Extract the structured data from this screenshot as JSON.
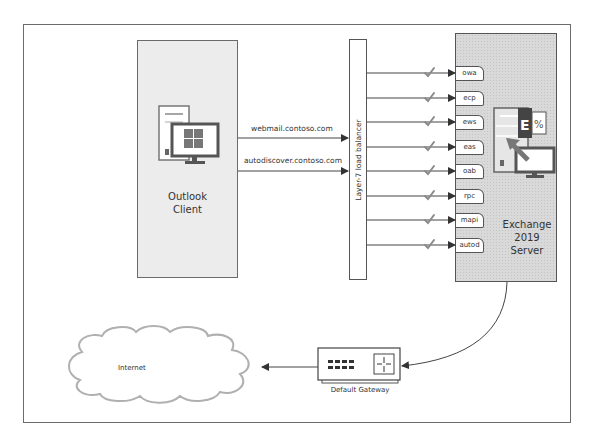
{
  "diagram": {
    "client": {
      "label_line1": "Outlook",
      "label_line2": "Client",
      "icon": "windows-desktop-icon"
    },
    "connections": {
      "webmail": "webmail.contoso.com",
      "autodiscover": "autodiscover.contoso.com"
    },
    "load_balancer": {
      "label": "Layer-7 load balancer"
    },
    "services": [
      {
        "label": "owa"
      },
      {
        "label": "ecp"
      },
      {
        "label": "ews"
      },
      {
        "label": "eas"
      },
      {
        "label": "oab"
      },
      {
        "label": "rpc"
      },
      {
        "label": "mapi"
      },
      {
        "label": "autod"
      }
    ],
    "server": {
      "label_line1": "Exchange",
      "label_line2": "2019",
      "label_line3": "Server",
      "icon": "exchange-server-icon"
    },
    "gateway": {
      "label": "Default Gateway",
      "icon": "router-icon"
    },
    "internet": {
      "label": "Internet",
      "icon": "cloud-icon"
    },
    "colors": {
      "line": "#444444",
      "client_fill": "#ececec",
      "server_fill": "#d9d9d9",
      "check": "#8a8a8a"
    }
  }
}
